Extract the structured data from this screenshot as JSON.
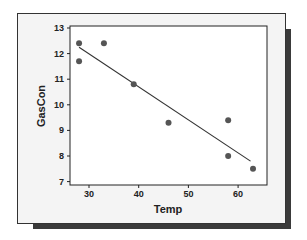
{
  "chart_data": {
    "type": "scatter",
    "title": "",
    "xlabel": "Temp",
    "ylabel": "GasCon",
    "xlim": [
      26.5,
      66
    ],
    "ylim": [
      6.85,
      13.1
    ],
    "x_ticks": [
      30,
      40,
      50,
      60
    ],
    "y_ticks": [
      7,
      8,
      9,
      10,
      11,
      12,
      13
    ],
    "grid": false,
    "legend": null,
    "series": [
      {
        "name": "observations",
        "type": "scatter",
        "color": "#555555",
        "points": [
          {
            "x": 28,
            "y": 12.4
          },
          {
            "x": 28,
            "y": 11.7
          },
          {
            "x": 33,
            "y": 12.4
          },
          {
            "x": 39,
            "y": 10.8
          },
          {
            "x": 46,
            "y": 9.3
          },
          {
            "x": 58,
            "y": 9.4
          },
          {
            "x": 58,
            "y": 8.0
          },
          {
            "x": 63,
            "y": 7.5
          }
        ]
      },
      {
        "name": "fitted line",
        "type": "line",
        "color": "#333333",
        "points": [
          {
            "x": 28,
            "y": 12.25
          },
          {
            "x": 62.5,
            "y": 7.8
          }
        ]
      }
    ]
  }
}
